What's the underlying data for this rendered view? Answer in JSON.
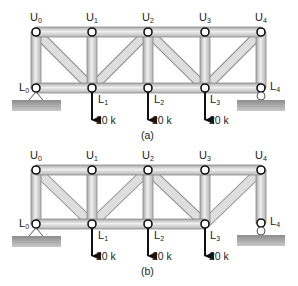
{
  "figure": {
    "panels": [
      {
        "caption": "(a)",
        "top_y": 32,
        "bottom_y": 88,
        "nodes_top": [
          {
            "name": "U",
            "sub": "0",
            "x": 36
          },
          {
            "name": "U",
            "sub": "1",
            "x": 92
          },
          {
            "name": "U",
            "sub": "2",
            "x": 148
          },
          {
            "name": "U",
            "sub": "3",
            "x": 205
          },
          {
            "name": "U",
            "sub": "4",
            "x": 261
          }
        ],
        "nodes_bottom": [
          {
            "name": "L",
            "sub": "0",
            "x": 36
          },
          {
            "name": "L",
            "sub": "1",
            "x": 92
          },
          {
            "name": "L",
            "sub": "2",
            "x": 148
          },
          {
            "name": "L",
            "sub": "3",
            "x": 205
          },
          {
            "name": "L",
            "sub": "4",
            "x": 261
          }
        ],
        "diagonals": [
          "U0-L1",
          "L1-U2",
          "U2-L3",
          "L3-U4"
        ],
        "bottom_chord": [
          "L0-L1",
          "L1-L2",
          "L2-L3",
          "L3-L4"
        ],
        "loads": [
          {
            "at": "L1",
            "label": "20 k"
          },
          {
            "at": "L2",
            "label": "20 k"
          },
          {
            "at": "L3",
            "label": "20 k"
          }
        ],
        "supports": {
          "left": "pin at L0",
          "right": "roller at L4"
        }
      },
      {
        "caption": "(b)",
        "top_y": 170,
        "bottom_y": 224,
        "nodes_top": [
          {
            "name": "U",
            "sub": "0",
            "x": 36
          },
          {
            "name": "U",
            "sub": "1",
            "x": 92
          },
          {
            "name": "U",
            "sub": "2",
            "x": 148
          },
          {
            "name": "U",
            "sub": "3",
            "x": 205
          },
          {
            "name": "U",
            "sub": "4",
            "x": 261
          }
        ],
        "nodes_bottom": [
          {
            "name": "L",
            "sub": "0",
            "x": 36
          },
          {
            "name": "L",
            "sub": "1",
            "x": 92
          },
          {
            "name": "L",
            "sub": "2",
            "x": 148
          },
          {
            "name": "L",
            "sub": "3",
            "x": 205
          },
          {
            "name": "L",
            "sub": "4",
            "x": 261
          }
        ],
        "diagonals": [
          "U0-L1",
          "L1-U2",
          "U2-L3",
          "L3-U4"
        ],
        "bottom_chord": [
          "L0-L1",
          "L1-L2",
          "L2-L3"
        ],
        "loads": [
          {
            "at": "L1",
            "label": "20 k"
          },
          {
            "at": "L2",
            "label": "20 k"
          },
          {
            "at": "L3",
            "label": "20 k"
          }
        ],
        "supports": {
          "left": "pin at L0",
          "right": "roller at L4"
        }
      }
    ]
  },
  "labels": {
    "a": {
      "U0": "U",
      "U0s": "0",
      "U1": "U",
      "U1s": "1",
      "U2": "U",
      "U2s": "2",
      "U3": "U",
      "U3s": "3",
      "U4": "U",
      "U4s": "4",
      "L0": "L",
      "L0s": "0",
      "L1": "L",
      "L1s": "1",
      "L2": "L",
      "L2s": "2",
      "L3": "L",
      "L3s": "3",
      "L4": "L",
      "L4s": "4",
      "load1": "20 k",
      "load2": "20 k",
      "load3": "20 k",
      "caption": "(a)"
    },
    "b": {
      "U0": "U",
      "U0s": "0",
      "U1": "U",
      "U1s": "1",
      "U2": "U",
      "U2s": "2",
      "U3": "U",
      "U3s": "3",
      "U4": "U",
      "U4s": "4",
      "L0": "L",
      "L0s": "0",
      "L1": "L",
      "L1s": "1",
      "L2": "L",
      "L2s": "2",
      "L3": "L",
      "L3s": "3",
      "L4": "L",
      "L4s": "4",
      "load1": "20 k",
      "load2": "20 k",
      "load3": "20 k",
      "caption": "(b)"
    }
  },
  "colors": {
    "member_fill": "#d4d4d4",
    "member_edge": "#8a8a8a",
    "ground": "#9a9a9a",
    "ink": "#111111"
  }
}
